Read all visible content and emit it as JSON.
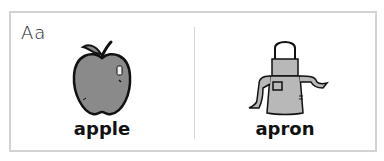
{
  "card": {
    "letter_heading": "Aa",
    "items": [
      {
        "word": "apple",
        "icon": "apple-icon"
      },
      {
        "word": "apron",
        "icon": "apron-icon"
      }
    ]
  },
  "colors": {
    "border": "#d2d2d2",
    "illustration_fill": "#8a8a8a",
    "apron_fill": "#b8b8b8",
    "ink": "#111111"
  }
}
